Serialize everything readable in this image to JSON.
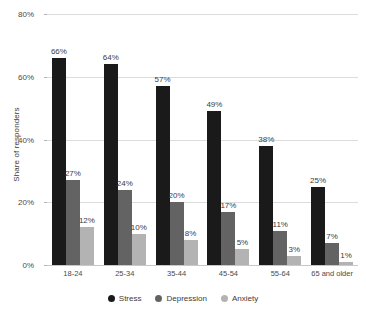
{
  "chart_data": {
    "type": "bar",
    "title": "",
    "subtitle": "",
    "xlabel": "",
    "ylabel": "Share of responders",
    "ylim": [
      0,
      80
    ],
    "yticks": [
      0,
      20,
      40,
      60,
      80
    ],
    "ytick_labels": [
      "0%",
      "20%",
      "40%",
      "60%",
      "80%"
    ],
    "grid": true,
    "legend_position": "bottom",
    "value_suffix": "%",
    "categories": [
      "18-24",
      "25-34",
      "35-44",
      "45-54",
      "55-64",
      "65 and older"
    ],
    "series": [
      {
        "name": "Stress",
        "color": "#1a1a1a",
        "values": [
          66,
          64,
          57,
          49,
          38,
          25
        ],
        "labels": [
          "66%",
          "64%",
          "57%",
          "49%",
          "38%",
          "25%"
        ]
      },
      {
        "name": "Depression",
        "color": "#636363",
        "values": [
          27,
          24,
          20,
          17,
          11,
          7
        ],
        "labels": [
          "27%",
          "24%",
          "20%",
          "17%",
          "11%",
          "7%"
        ]
      },
      {
        "name": "Anxiety",
        "color": "#b3b3b3",
        "values": [
          12,
          10,
          8,
          5,
          3,
          1
        ],
        "labels": [
          "12%",
          "10%",
          "8%",
          "5%",
          "3%",
          "1%"
        ]
      }
    ]
  }
}
